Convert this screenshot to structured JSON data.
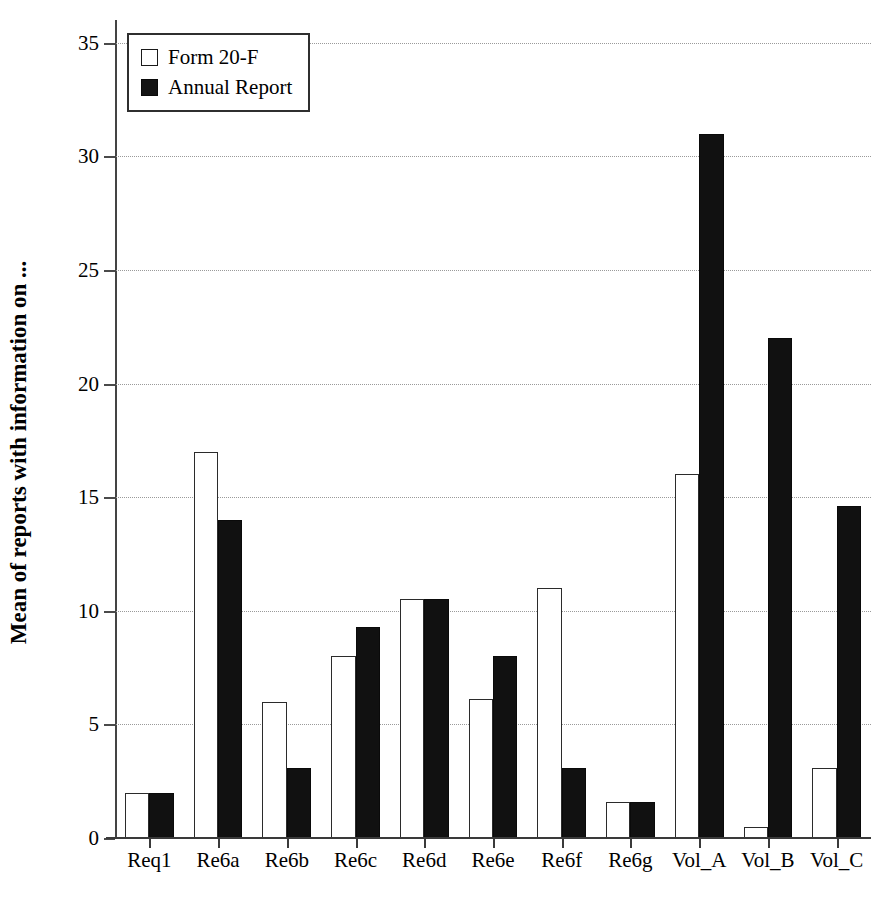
{
  "chart_data": {
    "type": "bar",
    "title": "",
    "subtitle": "",
    "xlabel": "",
    "ylabel": "Mean of reports with information on ...",
    "ylim": [
      0,
      36
    ],
    "yticks": [
      0,
      5,
      10,
      15,
      20,
      25,
      30,
      35
    ],
    "ytick_labels": [
      "0",
      "5",
      "10",
      "15",
      "20",
      "25",
      "30",
      "35"
    ],
    "grid": "horizontal-dotted",
    "legend_position": "top-left",
    "categories": [
      "Req1",
      "Re6a",
      "Re6b",
      "Re6c",
      "Re6d",
      "Re6e",
      "Re6f",
      "Re6g",
      "Vol_A",
      "Vol_B",
      "Vol_C"
    ],
    "series": [
      {
        "name": "Form 20-F",
        "style": "open",
        "color": "#ffffff",
        "edge_color": "#2b2b2b",
        "values": [
          2.0,
          17.0,
          6.0,
          8.0,
          10.5,
          6.1,
          11.0,
          1.6,
          16.0,
          0.5,
          3.1
        ]
      },
      {
        "name": "Annual Report",
        "style": "filled",
        "color": "#111111",
        "edge_color": "#0a0a0a",
        "values": [
          2.0,
          14.0,
          3.1,
          9.3,
          10.5,
          8.0,
          3.1,
          1.6,
          31.0,
          22.0,
          14.6
        ]
      }
    ]
  },
  "legend": {
    "items": [
      {
        "label": "Form 20-F",
        "swatch": "open-square-swatch"
      },
      {
        "label": "Annual Report",
        "swatch": "filled-square-swatch"
      }
    ]
  },
  "axes": {
    "y_title": "Mean of reports with information on ..."
  }
}
